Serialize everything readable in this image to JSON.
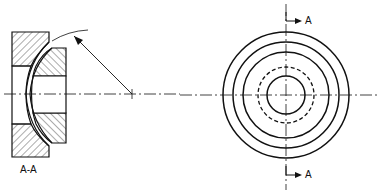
{
  "section_view": {
    "label": "A-A"
  },
  "front_view": {
    "cut_label_top": "A",
    "cut_label_bottom": "A"
  },
  "colors": {
    "line": "#111111",
    "background": "#ffffff"
  }
}
